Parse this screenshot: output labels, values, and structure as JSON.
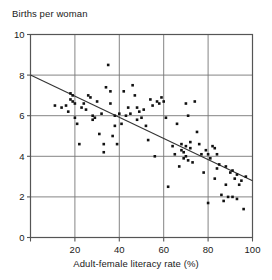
{
  "chart_data": {
    "type": "scatter",
    "title": "",
    "ylabel": "Births per woman",
    "xlabel": "Adult-female literacy rate (%)",
    "xlim": [
      0,
      100
    ],
    "ylim": [
      0,
      10
    ],
    "xticks": [
      0,
      20,
      40,
      60,
      80,
      100
    ],
    "xtick_labels": [
      "",
      "20",
      "40",
      "60",
      "80",
      "100"
    ],
    "yticks": [
      0,
      2,
      4,
      6,
      8,
      10
    ],
    "ytick_labels": [
      "0",
      "2",
      "4",
      "6",
      "8",
      "10"
    ],
    "grid": true,
    "grid_axes": "both",
    "legend": "none",
    "marker": "square",
    "marker_color": "#111111",
    "marker_size_px": 2.6,
    "line_color": "#333333",
    "axis_color": "#555555",
    "grid_color": "#777777",
    "trendline": {
      "type": "linear-fit",
      "x": [
        0,
        100
      ],
      "y": [
        8.0,
        2.8
      ]
    },
    "points": [
      [
        11,
        6.5
      ],
      [
        14,
        6.4
      ],
      [
        16,
        6.5
      ],
      [
        17,
        6.2
      ],
      [
        18,
        7.1
      ],
      [
        18,
        6.8
      ],
      [
        19,
        7.0
      ],
      [
        19,
        6.7
      ],
      [
        20,
        6.6
      ],
      [
        20,
        5.9
      ],
      [
        21,
        5.6
      ],
      [
        22,
        4.6
      ],
      [
        23,
        6.4
      ],
      [
        24,
        6.6
      ],
      [
        25,
        6.3
      ],
      [
        26,
        7.0
      ],
      [
        27,
        6.9
      ],
      [
        28,
        5.8
      ],
      [
        28,
        6.0
      ],
      [
        29,
        5.9
      ],
      [
        30,
        6.7
      ],
      [
        31,
        5.1
      ],
      [
        32,
        6.1
      ],
      [
        33,
        4.6
      ],
      [
        33,
        4.2
      ],
      [
        34,
        7.4
      ],
      [
        35,
        8.5
      ],
      [
        36,
        7.2
      ],
      [
        36,
        6.6
      ],
      [
        37,
        5.0
      ],
      [
        38,
        6.0
      ],
      [
        38,
        5.5
      ],
      [
        39,
        4.6
      ],
      [
        40,
        6.1
      ],
      [
        41,
        5.6
      ],
      [
        42,
        7.2
      ],
      [
        43,
        6.0
      ],
      [
        44,
        6.4
      ],
      [
        45,
        6.1
      ],
      [
        46,
        7.5
      ],
      [
        47,
        7.0
      ],
      [
        48,
        6.4
      ],
      [
        48,
        5.8
      ],
      [
        49,
        6.2
      ],
      [
        50,
        5.9
      ],
      [
        51,
        6.3
      ],
      [
        52,
        5.5
      ],
      [
        53,
        4.8
      ],
      [
        54,
        6.8
      ],
      [
        55,
        6.5
      ],
      [
        56,
        4.0
      ],
      [
        57,
        6.7
      ],
      [
        58,
        6.6
      ],
      [
        59,
        6.9
      ],
      [
        60,
        6.7
      ],
      [
        61,
        5.9
      ],
      [
        62,
        2.5
      ],
      [
        64,
        4.5
      ],
      [
        65,
        4.1
      ],
      [
        66,
        5.6
      ],
      [
        67,
        3.5
      ],
      [
        68,
        4.6
      ],
      [
        68,
        4.3
      ],
      [
        69,
        4.2
      ],
      [
        69,
        3.9
      ],
      [
        70,
        4.0
      ],
      [
        70,
        6.6
      ],
      [
        70,
        4.5
      ],
      [
        71,
        3.8
      ],
      [
        71,
        6.0
      ],
      [
        72,
        4.7
      ],
      [
        72,
        4.4
      ],
      [
        73,
        3.7
      ],
      [
        74,
        6.7
      ],
      [
        75,
        5.2
      ],
      [
        76,
        4.6
      ],
      [
        77,
        4.1
      ],
      [
        78,
        3.2
      ],
      [
        79,
        4.3
      ],
      [
        80,
        4.1
      ],
      [
        80,
        1.7
      ],
      [
        81,
        3.9
      ],
      [
        82,
        4.5
      ],
      [
        83,
        4.4
      ],
      [
        83,
        2.9
      ],
      [
        84,
        4.1
      ],
      [
        84,
        3.4
      ],
      [
        85,
        3.6
      ],
      [
        86,
        2.1
      ],
      [
        87,
        1.8
      ],
      [
        88,
        3.5
      ],
      [
        88,
        2.6
      ],
      [
        89,
        2.0
      ],
      [
        90,
        3.2
      ],
      [
        91,
        3.3
      ],
      [
        91,
        2.0
      ],
      [
        92,
        2.9
      ],
      [
        93,
        3.1
      ],
      [
        93,
        1.9
      ],
      [
        94,
        2.6
      ],
      [
        95,
        2.8
      ],
      [
        96,
        1.4
      ],
      [
        97,
        3.0
      ]
    ]
  }
}
